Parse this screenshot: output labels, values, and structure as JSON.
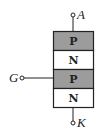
{
  "diagram": {
    "colors": {
      "p_layer": "#9c9c9c",
      "n_layer": "#ffffff",
      "stroke": "#222222"
    },
    "layers": [
      {
        "type": "P",
        "label": "P"
      },
      {
        "type": "N",
        "label": "N"
      },
      {
        "type": "P",
        "label": "P"
      },
      {
        "type": "N",
        "label": "N"
      }
    ],
    "terminals": {
      "anode": {
        "label": "A"
      },
      "gate": {
        "label": "G"
      },
      "cathode": {
        "label": "K"
      }
    }
  }
}
